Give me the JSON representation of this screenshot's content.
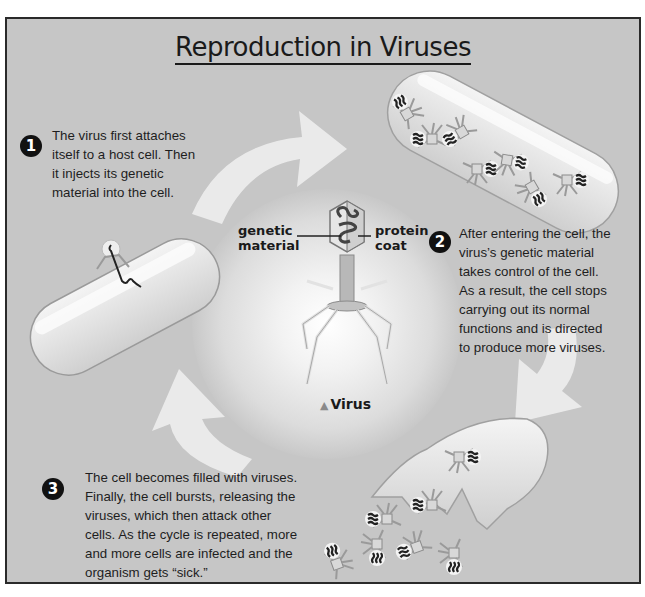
{
  "title": "Reproduction in Viruses",
  "steps": [
    {
      "number": "1",
      "text": "The virus first attaches itself to a host cell. Then it injects its genetic material into the cell."
    },
    {
      "number": "2",
      "text": "After entering the cell, the virus's genetic material takes control of the cell. As a result, the cell stops carrying out its normal functions and is directed to produce more viruses."
    },
    {
      "number": "3",
      "text": "The cell becomes filled with viruses. Finally, the cell bursts, releasing the viruses, which then attack other cells. As the cycle is repeated, more and more cells are infected and the organism gets “sick.”"
    }
  ],
  "virus_diagram": {
    "label_left_line1": "genetic",
    "label_left_line2": "material",
    "label_right_line1": "protein",
    "label_right_line2": "coat",
    "caption": "Virus",
    "caption_marker": "▲"
  },
  "step1_lines": [
    "The virus first attaches",
    "itself to a host cell. Then",
    "it injects its genetic",
    "material into the cell."
  ],
  "step2_lines": [
    "After entering the cell, the",
    "virus’s genetic material",
    "takes control of the cell.",
    "As a result, the cell stops",
    "carrying out its normal",
    "functions and is directed",
    "to produce more viruses."
  ],
  "step3_lines": [
    "The cell becomes filled with viruses.",
    "Finally, the cell bursts, releasing the",
    "viruses, which then attack other",
    "cells. As the cycle is repeated, more",
    "and more cells are infected and the",
    "organism gets “sick.”"
  ],
  "colors": {
    "background": "#c6c6c6",
    "frame_border": "#2a2a2a",
    "text": "#1e1e1e",
    "arrow": "#ececec",
    "cell_fill": "#e4e4e4"
  }
}
